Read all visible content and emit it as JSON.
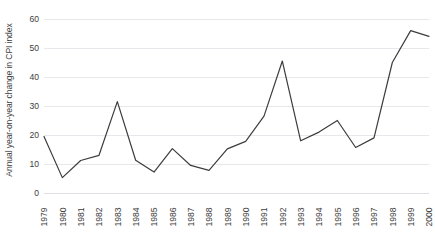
{
  "chart_data": {
    "type": "line",
    "title": "",
    "xlabel": "",
    "ylabel": "Annual year-on-year change in CPI index",
    "categories": [
      "1979",
      "1980",
      "1981",
      "1982",
      "1983",
      "1984",
      "1985",
      "1986",
      "1987",
      "1988",
      "1989",
      "1990",
      "1991",
      "1992",
      "1993",
      "1994",
      "1995",
      "1996",
      "1997",
      "1998",
      "1999",
      "2000"
    ],
    "values": [
      19.5,
      5.3,
      11.2,
      13.0,
      31.5,
      11.3,
      7.2,
      15.3,
      9.5,
      7.8,
      15.2,
      17.8,
      26.5,
      45.5,
      18.0,
      21.0,
      25.0,
      15.7,
      19.0,
      45.0,
      56.0,
      54.0
    ],
    "series": [
      {
        "name": "Annual year-on-year change in CPI index",
        "values": [
          19.5,
          5.3,
          11.2,
          13.0,
          31.5,
          11.3,
          7.2,
          15.3,
          9.5,
          7.8,
          15.2,
          17.8,
          26.5,
          45.5,
          18.0,
          21.0,
          25.0,
          15.7,
          19.0,
          45.0,
          56.0,
          54.0
        ],
        "color": "#3c3c3c"
      }
    ],
    "ylim": [
      0,
      60
    ],
    "yticks": [
      0,
      10,
      20,
      30,
      40,
      50,
      60
    ],
    "ytick_labels": [
      "0",
      "10",
      "20",
      "30",
      "40",
      "50",
      "60"
    ],
    "grid": true,
    "grid_axis": "y",
    "legend": false,
    "legend_position": "none",
    "line_color": "#3c3c3c",
    "line_width": 1.2,
    "markers": false,
    "grid_color": "#e8e8ec",
    "background_color": "#ffffff",
    "text_color": "#3d3d3d",
    "xtick_rotation": -90
  }
}
